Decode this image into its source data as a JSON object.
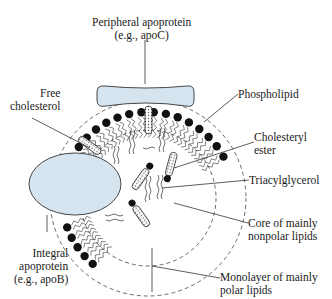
{
  "colors": {
    "apoprotein_fill": "#d6e4ef",
    "head_fill": "#111111",
    "line": "#333333",
    "background": "#ffffff"
  },
  "labels": {
    "peripheral_apoprotein": {
      "line1": "Peripheral apoprotein",
      "line2": "(e.g., apoC)"
    },
    "free_cholesterol": {
      "line1": "Free",
      "line2": "cholesterol"
    },
    "phospholipid": {
      "line1": "Phospholipid"
    },
    "cholesteryl_ester": {
      "line1": "Cholesteryl",
      "line2": "ester"
    },
    "triacylglycerol": {
      "line1": "Triacylglycerol"
    },
    "core": {
      "line1": "Core of mainly",
      "line2": "nonpolar lipids"
    },
    "integral_apoprotein": {
      "line1": "Integral",
      "line2": "apoprotein",
      "line3": "(e.g., apoB)"
    },
    "monolayer": {
      "line1": "Monolayer of mainly",
      "line2": "polar lipids"
    }
  }
}
